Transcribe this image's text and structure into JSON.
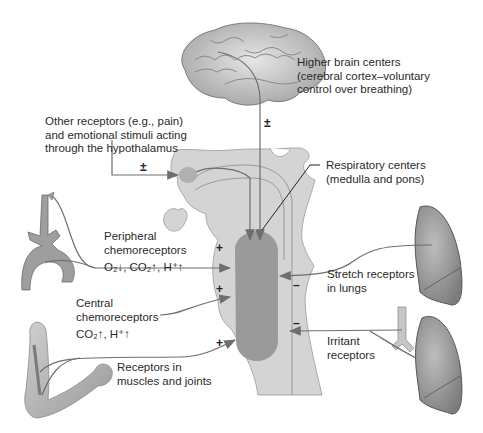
{
  "labels": {
    "higher_brain": [
      "Higher brain centers",
      "(cerebral cortex–voluntary",
      "control over breathing)"
    ],
    "other_receptors": [
      "Other receptors (e.g., pain)",
      "and emotional stimuli acting",
      "through the hypothalamus"
    ],
    "respiratory_centers": [
      "Respiratory centers",
      "(medulla and pons)"
    ],
    "peripheral": [
      "Peripheral",
      "chemoreceptors"
    ],
    "peripheral_stimuli": "O₂↓, CO₂↑, H⁺↑",
    "central": [
      "Central",
      "chemoreceptors"
    ],
    "central_stimuli": "CO₂↑, H⁺↑",
    "stretch": [
      "Stretch receptors",
      "in lungs"
    ],
    "irritant": [
      "Irritant",
      "receptors"
    ],
    "muscles": [
      "Receptors in",
      "muscles and joints"
    ]
  },
  "signs": {
    "higher_brain": "±",
    "hypothalamus": "±",
    "peripheral": "+",
    "central": "+",
    "muscles": "+",
    "stretch": "–",
    "irritant": "–"
  },
  "colors": {
    "brainstem_fill": "#d4d4d4",
    "center_fill": "#9a9a9a",
    "hypothalamus_fill": "#b0b0b0",
    "arrow": "#6e6e6e",
    "organ_fill": "#a8a8a8",
    "organ_dark": "#7a7a7a"
  }
}
